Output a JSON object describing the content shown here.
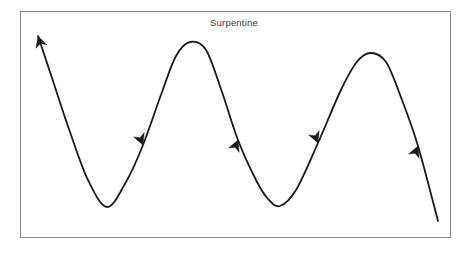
{
  "figure": {
    "title": "Surpentine",
    "background_color": "#ffffff",
    "frame": {
      "name": "plot-border",
      "color": "#8a8a8a",
      "stroke_width": 1,
      "x": 20,
      "y": 11,
      "width": 431,
      "height": 227
    }
  },
  "chart_data": {
    "type": "line",
    "title": "Surpentine",
    "subtitle": "",
    "xlabel": "",
    "ylabel": "",
    "grid": false,
    "legend": "none",
    "axis_visible": false,
    "tick_labels_x": [],
    "tick_labels_y": [],
    "xlim": [
      20,
      451
    ],
    "ylim": [
      11,
      238
    ],
    "series": [
      {
        "name": "serpentine-curve",
        "color": "#1a1a1a",
        "stroke_width": 1.8,
        "description": "Continuous sinusoidal serpentine curve with directional arrowheads indicating flow from upper-left upward start, then down-right along two full wave cycles, exiting lower-right.",
        "points": [
          {
            "x": 38,
            "y": 36
          },
          {
            "x": 52,
            "y": 78
          },
          {
            "x": 70,
            "y": 132
          },
          {
            "x": 88,
            "y": 180
          },
          {
            "x": 107,
            "y": 207
          },
          {
            "x": 126,
            "y": 182
          },
          {
            "x": 143,
            "y": 145
          },
          {
            "x": 162,
            "y": 92
          },
          {
            "x": 176,
            "y": 56
          },
          {
            "x": 190,
            "y": 42
          },
          {
            "x": 206,
            "y": 50
          },
          {
            "x": 222,
            "y": 92
          },
          {
            "x": 238,
            "y": 140
          },
          {
            "x": 256,
            "y": 180
          },
          {
            "x": 268,
            "y": 199
          },
          {
            "x": 280,
            "y": 206
          },
          {
            "x": 296,
            "y": 190
          },
          {
            "x": 318,
            "y": 143
          },
          {
            "x": 340,
            "y": 92
          },
          {
            "x": 356,
            "y": 63
          },
          {
            "x": 370,
            "y": 53
          },
          {
            "x": 386,
            "y": 62
          },
          {
            "x": 402,
            "y": 100
          },
          {
            "x": 418,
            "y": 146
          },
          {
            "x": 438,
            "y": 221
          }
        ],
        "peaks": [
          {
            "x": 190,
            "y": 42
          },
          {
            "x": 370,
            "y": 53
          }
        ],
        "troughs": [
          {
            "x": 107,
            "y": 207
          },
          {
            "x": 280,
            "y": 206
          }
        ]
      }
    ],
    "annotations": [
      {
        "name": "arrowhead-start-up-left",
        "type": "arrowhead",
        "x": 38,
        "y": 36,
        "angle_deg": -108,
        "direction": "up-left",
        "size": 11,
        "color": "#1a1a1a"
      },
      {
        "name": "arrowhead-descending-1",
        "type": "arrowhead",
        "x": 143,
        "y": 145,
        "angle_deg": 68,
        "direction": "down-right",
        "size": 11,
        "color": "#1a1a1a"
      },
      {
        "name": "arrowhead-ascending-1",
        "type": "arrowhead",
        "x": 238,
        "y": 140,
        "angle_deg": -68,
        "direction": "up-right",
        "size": 11,
        "color": "#1a1a1a"
      },
      {
        "name": "arrowhead-descending-2",
        "type": "arrowhead",
        "x": 318,
        "y": 143,
        "angle_deg": 68,
        "direction": "down-right",
        "size": 11,
        "color": "#1a1a1a"
      },
      {
        "name": "arrowhead-ascending-2",
        "type": "arrowhead",
        "x": 418,
        "y": 146,
        "angle_deg": -68,
        "direction": "up-right",
        "size": 11,
        "color": "#1a1a1a"
      }
    ]
  }
}
